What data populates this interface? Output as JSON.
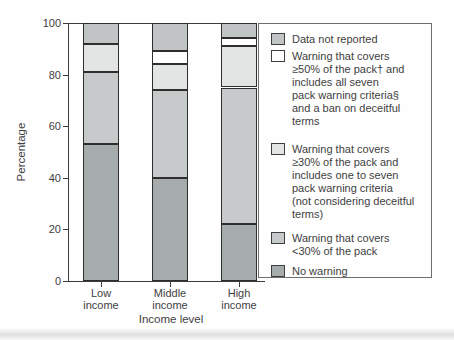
{
  "chart_data": {
    "type": "bar",
    "stacked": true,
    "title": "",
    "xlabel": "Income level",
    "ylabel": "Percentage",
    "ylim": [
      0,
      100
    ],
    "yticks": [
      0,
      20,
      40,
      60,
      80,
      100
    ],
    "grid": "top-line-at-100-only",
    "legend_position": "right",
    "categories": [
      "Low\nincome",
      "Middle\nincome",
      "High\nincome"
    ],
    "series": [
      {
        "name": "No warning",
        "color": "#a6abab",
        "values": [
          53,
          40,
          22
        ]
      },
      {
        "name": "Warning that covers\n<30% of the pack",
        "color": "#c6caca",
        "values": [
          28,
          34,
          53
        ]
      },
      {
        "name": "Warning that covers\n≥30% of the pack and\nincludes one to seven\npack warning criteria\n(not considering deceitful\nterms)",
        "color": "#e3e5e5",
        "values": [
          11,
          10,
          16
        ]
      },
      {
        "name": "Warning that covers\n≥50% of the pack† and\nincludes all seven\npack warning criteria§\nand a ban on deceitful\nterms",
        "color": "#ffffff",
        "values": [
          0,
          5,
          3
        ]
      },
      {
        "name": "Data not reported",
        "color": "#c1c4c4",
        "values": [
          8,
          11,
          6
        ]
      }
    ],
    "legend_order_top_to_bottom": [
      "Data not reported",
      "Warning that covers ≥50% of the pack† and includes all seven pack warning criteria§ and a ban on deceitful terms",
      "Warning that covers ≥30% of the pack and includes one to seven pack warning criteria (not considering deceitful terms)",
      "Warning that covers <30% of the pack",
      "No warning"
    ]
  },
  "colors": {
    "segment_border": "#2e2e2e",
    "axis": "#3c3c3c",
    "text": "#3f3f3f",
    "legend_border": "#6e6e6e",
    "background": "#fefefe"
  }
}
